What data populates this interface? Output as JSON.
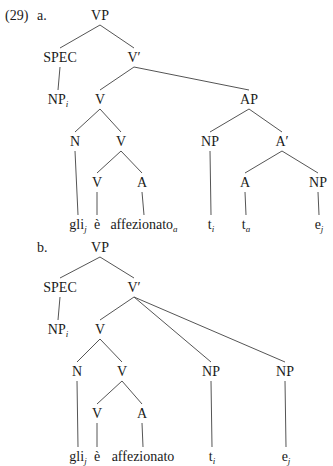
{
  "example_number": "(29)",
  "trees": [
    {
      "label": "a.",
      "nodes": [
        {
          "id": "VP",
          "text": "VP",
          "sub": "",
          "x": 100,
          "y": 9
        },
        {
          "id": "SPEC",
          "text": "SPEC",
          "sub": "",
          "x": 60,
          "y": 51
        },
        {
          "id": "Vbar",
          "text": "V′",
          "sub": "",
          "x": 134,
          "y": 51
        },
        {
          "id": "NPi",
          "text": "NP",
          "sub": "i",
          "x": 58,
          "y": 93
        },
        {
          "id": "V1",
          "text": "V",
          "sub": "",
          "x": 100,
          "y": 93
        },
        {
          "id": "AP",
          "text": "AP",
          "sub": "",
          "x": 249,
          "y": 93
        },
        {
          "id": "N",
          "text": "N",
          "sub": "",
          "x": 75,
          "y": 135
        },
        {
          "id": "V2",
          "text": "V",
          "sub": "",
          "x": 121,
          "y": 135
        },
        {
          "id": "NP1",
          "text": "NP",
          "sub": "",
          "x": 210,
          "y": 135
        },
        {
          "id": "Abar",
          "text": "A′",
          "sub": "",
          "x": 282,
          "y": 135
        },
        {
          "id": "V3",
          "text": "V",
          "sub": "",
          "x": 97,
          "y": 176
        },
        {
          "id": "A1",
          "text": "A",
          "sub": "",
          "x": 142,
          "y": 176
        },
        {
          "id": "A2",
          "text": "A",
          "sub": "",
          "x": 245,
          "y": 176
        },
        {
          "id": "NP2",
          "text": "NP",
          "sub": "",
          "x": 318,
          "y": 176
        },
        {
          "id": "gli",
          "text": "gli",
          "sub": "j",
          "x": 78,
          "y": 218
        },
        {
          "id": "e_acc",
          "text": "è",
          "sub": "",
          "x": 97,
          "y": 218
        },
        {
          "id": "affez",
          "text": "affezionato",
          "sub": "a",
          "x": 144,
          "y": 218
        },
        {
          "id": "ti",
          "text": "t",
          "sub": "i",
          "x": 211,
          "y": 218
        },
        {
          "id": "ta",
          "text": "t",
          "sub": "a",
          "x": 246,
          "y": 218
        },
        {
          "id": "ej",
          "text": "e",
          "sub": "j",
          "x": 319,
          "y": 218
        }
      ],
      "edges": [
        [
          "VP",
          "SPEC"
        ],
        [
          "VP",
          "Vbar"
        ],
        [
          "SPEC",
          "NPi"
        ],
        [
          "Vbar",
          "V1"
        ],
        [
          "Vbar",
          "AP"
        ],
        [
          "V1",
          "N"
        ],
        [
          "V1",
          "V2"
        ],
        [
          "AP",
          "NP1"
        ],
        [
          "AP",
          "Abar"
        ],
        [
          "V2",
          "V3"
        ],
        [
          "V2",
          "A1"
        ],
        [
          "Abar",
          "A2"
        ],
        [
          "Abar",
          "NP2"
        ],
        [
          "N",
          "gli"
        ],
        [
          "V3",
          "e_acc"
        ],
        [
          "A1",
          "affez"
        ],
        [
          "NP1",
          "ti"
        ],
        [
          "A2",
          "ta"
        ],
        [
          "NP2",
          "ej"
        ]
      ]
    },
    {
      "label": "b.",
      "nodes": [
        {
          "id": "VP",
          "text": "VP",
          "sub": "",
          "x": 100,
          "y": 241
        },
        {
          "id": "SPEC",
          "text": "SPEC",
          "sub": "",
          "x": 60,
          "y": 281
        },
        {
          "id": "Vbar",
          "text": "V′",
          "sub": "",
          "x": 134,
          "y": 281
        },
        {
          "id": "NPi",
          "text": "NP",
          "sub": "i",
          "x": 58,
          "y": 323
        },
        {
          "id": "V1",
          "text": "V",
          "sub": "",
          "x": 100,
          "y": 323
        },
        {
          "id": "N",
          "text": "N",
          "sub": "",
          "x": 77,
          "y": 365
        },
        {
          "id": "V2",
          "text": "V",
          "sub": "",
          "x": 122,
          "y": 365
        },
        {
          "id": "NP1",
          "text": "NP",
          "sub": "",
          "x": 211,
          "y": 365
        },
        {
          "id": "NP2",
          "text": "NP",
          "sub": "",
          "x": 285,
          "y": 365
        },
        {
          "id": "V3",
          "text": "V",
          "sub": "",
          "x": 97,
          "y": 407
        },
        {
          "id": "A1",
          "text": "A",
          "sub": "",
          "x": 142,
          "y": 407
        },
        {
          "id": "gli",
          "text": "gli",
          "sub": "j",
          "x": 78,
          "y": 450
        },
        {
          "id": "e_acc",
          "text": "è",
          "sub": "",
          "x": 97,
          "y": 450
        },
        {
          "id": "affez",
          "text": "affezionato",
          "sub": "",
          "x": 143,
          "y": 450
        },
        {
          "id": "ti",
          "text": "t",
          "sub": "i",
          "x": 212,
          "y": 450
        },
        {
          "id": "ej",
          "text": "e",
          "sub": "j",
          "x": 286,
          "y": 450
        }
      ],
      "edges": [
        [
          "VP",
          "SPEC"
        ],
        [
          "VP",
          "Vbar"
        ],
        [
          "SPEC",
          "NPi"
        ],
        [
          "Vbar",
          "V1"
        ],
        [
          "Vbar",
          "NP1"
        ],
        [
          "Vbar",
          "NP2"
        ],
        [
          "V1",
          "N"
        ],
        [
          "V1",
          "V2"
        ],
        [
          "V2",
          "V3"
        ],
        [
          "V2",
          "A1"
        ],
        [
          "N",
          "gli"
        ],
        [
          "V3",
          "e_acc"
        ],
        [
          "A1",
          "affez"
        ],
        [
          "NP1",
          "ti"
        ],
        [
          "NP2",
          "ej"
        ]
      ]
    }
  ],
  "colors": {
    "line": "#555555",
    "text": "#1a1a1a",
    "background": "#ffffff"
  }
}
